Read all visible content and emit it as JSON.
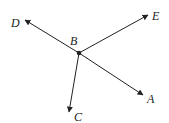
{
  "diagram": {
    "colors": {
      "stroke": "#222222",
      "background": "#ffffff"
    },
    "center": {
      "label": "B",
      "x": 79,
      "y": 53,
      "label_x": 70,
      "label_y": 45
    },
    "rays": [
      {
        "name": "ray-BD",
        "label": "D",
        "tip_x": 25,
        "tip_y": 20,
        "label_x": 11,
        "label_y": 27
      },
      {
        "name": "ray-BE",
        "label": "E",
        "tip_x": 148,
        "tip_y": 15,
        "label_x": 152,
        "label_y": 20
      },
      {
        "name": "ray-BA",
        "label": "A",
        "tip_x": 143,
        "tip_y": 95,
        "label_x": 147,
        "label_y": 103
      },
      {
        "name": "ray-BC",
        "label": "C",
        "tip_x": 69,
        "tip_y": 112,
        "label_x": 74,
        "label_y": 121
      }
    ]
  }
}
